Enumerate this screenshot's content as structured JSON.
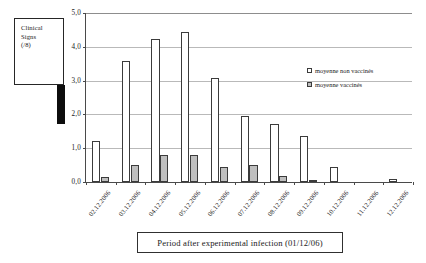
{
  "ylabel_box": {
    "line1": "Clinical",
    "line2": "Signs",
    "line3": "(/8)"
  },
  "caption": "Period after experimental infection  (01/12/06)",
  "legend": {
    "position": "inside-top-right",
    "entries": [
      {
        "label": "moyenne non vaccinés",
        "color": "#ffffff"
      },
      {
        "label": "moyenne vaccinés",
        "color": "#bfbfbf"
      }
    ]
  },
  "axis": {
    "y_ticks": [
      "0,0",
      "1,0",
      "2,0",
      "3,0",
      "4,0",
      "5,0"
    ],
    "y_tick_values": [
      0,
      1,
      2,
      3,
      4,
      5
    ]
  },
  "chart_data": {
    "type": "bar",
    "title": "",
    "subtitle": "",
    "xlabel": "Period after experimental infection  (01/12/06)",
    "ylabel": "Clinical Signs (/8)",
    "ylim": [
      0,
      5
    ],
    "grid": true,
    "legend_position": "inside-top-right",
    "categories": [
      "02.12.2006",
      "03.12.2006",
      "04.12.2006",
      "05.12.2006",
      "06.12.2006",
      "07.12.2006",
      "08.12.2006",
      "09.12.2006",
      "10.12.2006",
      "11.12.2006",
      "12.12.2006"
    ],
    "series": [
      {
        "name": "moyenne non vaccinés",
        "color": "#ffffff",
        "values": [
          1.2,
          3.55,
          4.2,
          4.4,
          3.05,
          1.95,
          1.7,
          1.35,
          0.45,
          0.0,
          0.1
        ]
      },
      {
        "name": "moyenne vaccinés",
        "color": "#bfbfbf",
        "values": [
          0.15,
          0.5,
          0.8,
          0.78,
          0.45,
          0.5,
          0.18,
          0.03,
          0.0,
          0.0,
          0.0
        ]
      }
    ]
  }
}
